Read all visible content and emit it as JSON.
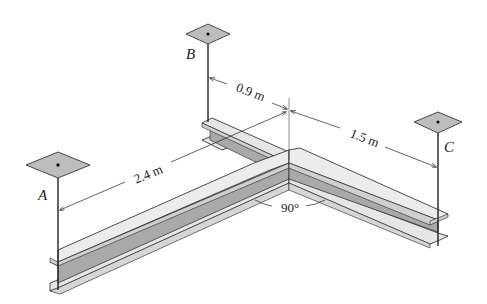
{
  "figure": {
    "type": "isometric beam diagram"
  },
  "supports": {
    "A": {
      "label": "A"
    },
    "B": {
      "label": "B"
    },
    "C": {
      "label": "C"
    }
  },
  "dimensions": {
    "ab": "2.4 m",
    "b_offset": "0.9 m",
    "c_span": "1.5 m",
    "angle": "90°"
  },
  "colors": {
    "line": "#222222",
    "plate_fill": "#bdbdbd",
    "flange_fill": "#e6e6e6",
    "web_fill": "#a9a9a9",
    "flange_side": "#d0d0d0"
  }
}
